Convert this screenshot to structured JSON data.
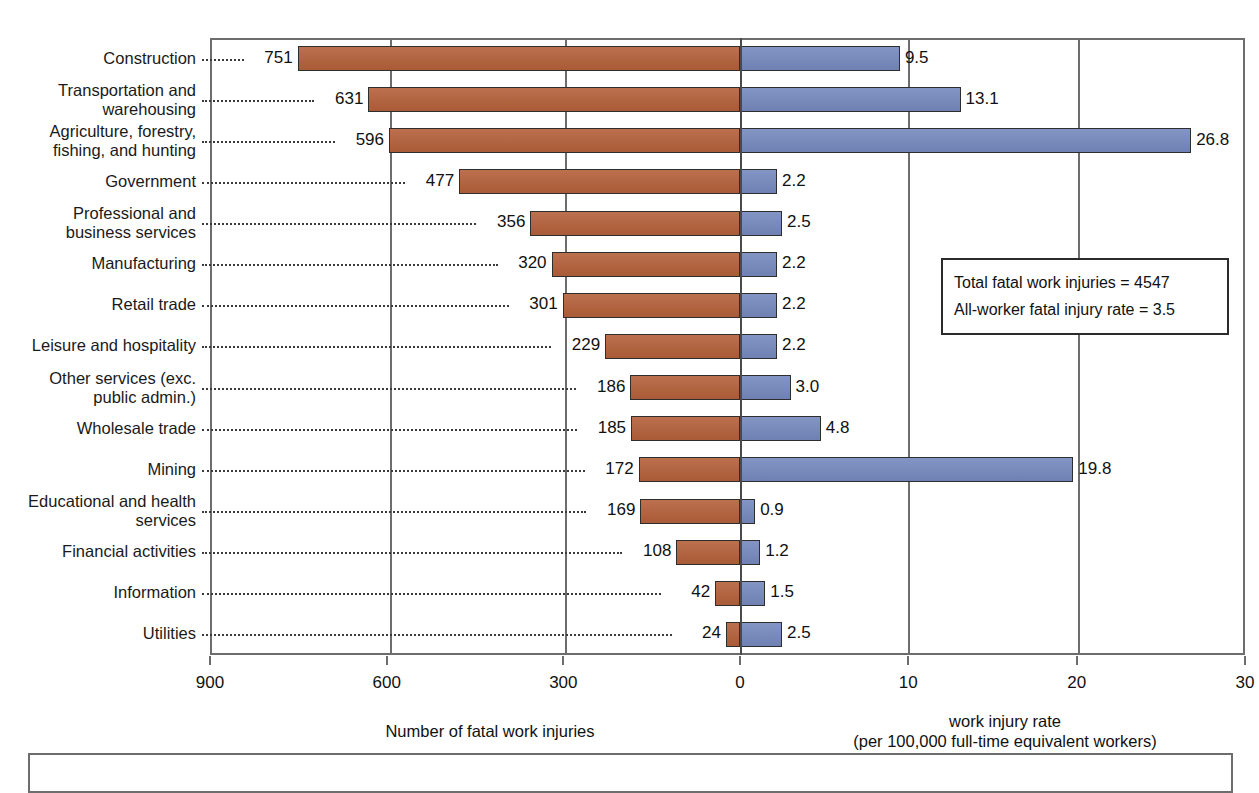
{
  "chart_data": {
    "type": "bar",
    "orientation": "horizontal-bidirectional",
    "title": "",
    "categories": [
      "Construction",
      "Transportation and warehousing",
      "Agriculture, forestry, fishing, and hunting",
      "Government",
      "Professional and business services",
      "Manufacturing",
      "Retail trade",
      "Leisure and hospitality",
      "Other services (exc. public admin.)",
      "Wholesale trade",
      "Mining",
      "Educational and health services",
      "Financial activities",
      "Information",
      "Utilities"
    ],
    "series": [
      {
        "name": "Number of fatal work injuries",
        "side": "left",
        "color": "#b4603a",
        "values": [
          751,
          631,
          596,
          477,
          356,
          320,
          301,
          229,
          186,
          185,
          172,
          169,
          108,
          42,
          24
        ]
      },
      {
        "name": "work injury rate (per 100,000 full-time equivalent workers)",
        "side": "right",
        "color": "#7589bd",
        "values": [
          9.5,
          13.1,
          26.8,
          2.2,
          2.5,
          2.2,
          2.2,
          2.2,
          3.0,
          4.8,
          19.8,
          0.9,
          1.2,
          1.5,
          2.5
        ]
      }
    ],
    "left_axis": {
      "label": "Number of fatal work injuries",
      "ticks": [
        "900",
        "600",
        "300",
        "0"
      ],
      "tick_values": [
        900,
        600,
        300,
        0
      ],
      "range": [
        900,
        0
      ],
      "direction": "descending"
    },
    "right_axis": {
      "label_line1": "work injury rate",
      "label_line2": "(per 100,000 full-time equivalent workers)",
      "ticks": [
        "0",
        "10",
        "20",
        "30"
      ],
      "tick_values": [
        0,
        10,
        20,
        30
      ],
      "range": [
        0,
        30
      ]
    },
    "grid": true,
    "legend": null,
    "annotations": [
      "Total fatal work injuries = 4547",
      "All-worker fatal injury rate = 3.5"
    ]
  },
  "rows": [
    {
      "label_line1": "Construction",
      "label_line2": "",
      "count": "751",
      "rate": "9.5"
    },
    {
      "label_line1": "Transportation and",
      "label_line2": "warehousing",
      "count": "631",
      "rate": "13.1"
    },
    {
      "label_line1": "Agriculture, forestry,",
      "label_line2": "fishing, and hunting",
      "count": "596",
      "rate": "26.8"
    },
    {
      "label_line1": "Government",
      "label_line2": "",
      "count": "477",
      "rate": "2.2"
    },
    {
      "label_line1": "Professional and",
      "label_line2": "business services",
      "count": "356",
      "rate": "2.5"
    },
    {
      "label_line1": "Manufacturing",
      "label_line2": "",
      "count": "320",
      "rate": "2.2"
    },
    {
      "label_line1": "Retail trade",
      "label_line2": "",
      "count": "301",
      "rate": "2.2"
    },
    {
      "label_line1": "Leisure and hospitality",
      "label_line2": "",
      "count": "229",
      "rate": "2.2"
    },
    {
      "label_line1": "Other services (exc.",
      "label_line2": "public admin.)",
      "count": "186",
      "rate": "3.0"
    },
    {
      "label_line1": "Wholesale trade",
      "label_line2": "",
      "count": "185",
      "rate": "4.8"
    },
    {
      "label_line1": "Mining",
      "label_line2": "",
      "count": "172",
      "rate": "19.8"
    },
    {
      "label_line1": "Educational and health",
      "label_line2": "services",
      "count": "169",
      "rate": "0.9"
    },
    {
      "label_line1": "Financial activities",
      "label_line2": "",
      "count": "108",
      "rate": "1.2"
    },
    {
      "label_line1": "Information",
      "label_line2": "",
      "count": "42",
      "rate": "1.5"
    },
    {
      "label_line1": "Utilities",
      "label_line2": "",
      "count": "24",
      "rate": "2.5"
    }
  ],
  "left_ticks": [
    {
      "label": "900"
    },
    {
      "label": "600"
    },
    {
      "label": "300"
    },
    {
      "label": "0"
    }
  ],
  "right_ticks": [
    {
      "label": "0"
    },
    {
      "label": "10"
    },
    {
      "label": "20"
    },
    {
      "label": "30"
    }
  ],
  "axis_titles": {
    "left": "Number of fatal work injuries",
    "right_line1": "work injury rate",
    "right_line2": "(per 100,000 full-time equivalent workers)"
  },
  "annotation_box": {
    "line1": "Total fatal work injuries = 4547",
    "line2": "All-worker fatal injury rate = 3.5"
  },
  "colors": {
    "left_bar": "#b4603a",
    "right_bar": "#7589bd",
    "axis": "#6d6d6d",
    "text": "#111111"
  }
}
